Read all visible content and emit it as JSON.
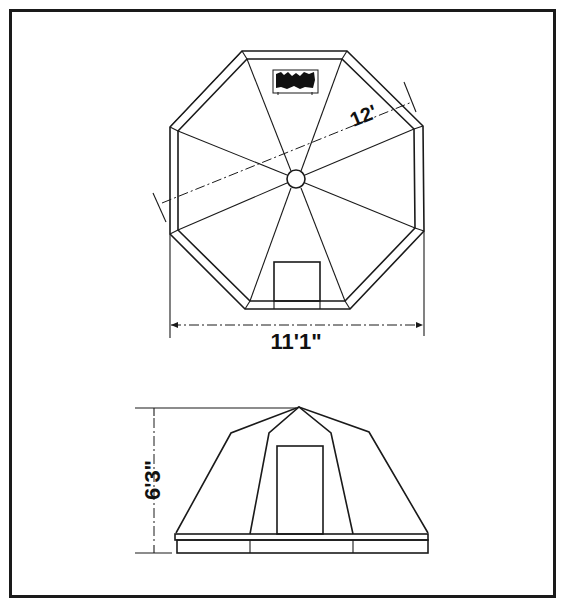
{
  "diagram": {
    "type": "technical drawing",
    "colors": {
      "ink": "#1a1a1a",
      "paper": "#ffffff"
    },
    "plan_view": {
      "width_label": "11'1\"",
      "diagonal_label": "12'"
    },
    "elevation_view": {
      "height_label": "6'3\""
    }
  }
}
